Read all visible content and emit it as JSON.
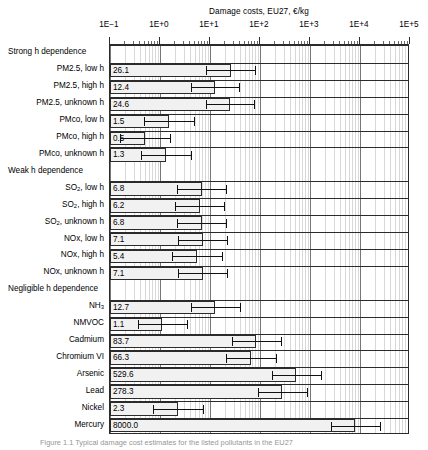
{
  "chart_data": {
    "type": "bar",
    "orientation": "horizontal",
    "title": "Damage costs, EU27, €/kg",
    "xlabel": "Damage costs, EU27, €/kg",
    "ylabel": "",
    "xscale": "log",
    "xlim": [
      0.1,
      100000
    ],
    "xticks": [
      0.1,
      1,
      10,
      100,
      1000,
      10000,
      100000
    ],
    "xticklabels": [
      "1E−1",
      "1E+0",
      "1E+1",
      "1E+2",
      "1E+3",
      "1E+4",
      "1E+5"
    ],
    "grid": true,
    "grid_minor": true,
    "legend": null,
    "value_label_position": "inside-left",
    "groups": [
      {
        "label": "Strong h dependence",
        "rows": [
          {
            "category": "PM2.5, low h",
            "value": 26.1,
            "low": 8.3,
            "high": 79.0
          },
          {
            "category": "PM2.5, high h",
            "value": 12.4,
            "low": 4.1,
            "high": 38.0
          },
          {
            "category": "PM2.5, unknown h",
            "value": 24.6,
            "low": 8.2,
            "high": 75.0
          },
          {
            "category": "PMco, low h",
            "value": 1.5,
            "low": 0.48,
            "high": 4.7
          },
          {
            "category": "PMco, high h",
            "value": 0.5,
            "low": 0.16,
            "high": 1.6
          },
          {
            "category": "PMco, unknown h",
            "value": 1.3,
            "low": 0.42,
            "high": 4.1
          }
        ]
      },
      {
        "label": "Weak h dependence",
        "rows": [
          {
            "category": "SO2, low h",
            "value": 6.8,
            "low": 2.2,
            "high": 21.0
          },
          {
            "category": "SO2, high h",
            "value": 6.2,
            "low": 2.0,
            "high": 19.0
          },
          {
            "category": "SO2, unknown h",
            "value": 6.8,
            "low": 2.2,
            "high": 21.0
          },
          {
            "category": "NOx, low h",
            "value": 7.1,
            "low": 2.3,
            "high": 22.0
          },
          {
            "category": "NOx, high h",
            "value": 5.4,
            "low": 1.7,
            "high": 17.0
          },
          {
            "category": "NOx, unknown h",
            "value": 7.1,
            "low": 2.3,
            "high": 22.0
          }
        ]
      },
      {
        "label": "Negligible h dependence",
        "rows": [
          {
            "category": "NH3",
            "value": 12.7,
            "low": 4.1,
            "high": 39.0
          },
          {
            "category": "NMVOC",
            "value": 1.1,
            "low": 0.36,
            "high": 3.4
          },
          {
            "category": "Cadmium",
            "value": 83.7,
            "low": 27.0,
            "high": 260.0
          },
          {
            "category": "Chromium VI",
            "value": 66.3,
            "low": 21.0,
            "high": 205.0
          },
          {
            "category": "Arsenic",
            "value": 529.6,
            "low": 170.0,
            "high": 1650.0
          },
          {
            "category": "Lead",
            "value": 278.3,
            "low": 90.0,
            "high": 870.0
          },
          {
            "category": "Nickel",
            "value": 2.3,
            "low": 0.74,
            "high": 7.2
          },
          {
            "category": "Mercury",
            "value": 8000.0,
            "low": 2600.0,
            "high": 25000.0
          }
        ]
      }
    ]
  },
  "figure": {
    "caption": "Figure 1.1   Typical damage cost estimates for the listed pollutants in the EU27"
  },
  "colors": {
    "bar_fill": "#f1f1f1",
    "bar_stroke": "#2b2b2b",
    "error_bar": "#111111",
    "gridline_minor": "#d8d8d8",
    "gridline_major": "#777777",
    "frame": "#2b2b2b",
    "text": "#000000"
  }
}
